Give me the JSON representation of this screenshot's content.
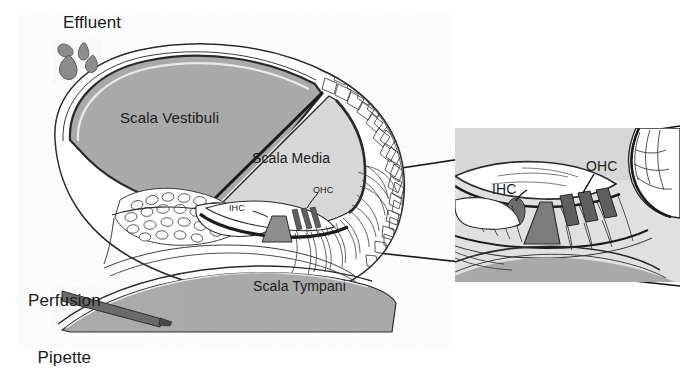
{
  "figure": {
    "type": "anatomical-diagram",
    "background_color": "#ffffff",
    "colors": {
      "scala_vestibuli_fill": "#a9a9a9",
      "scala_media_fill": "#d7d7d7",
      "scala_tympani_fill": "#a9a9a9",
      "outline": "#1a1a1a",
      "hair_cell_fill": "#6e6e6e",
      "pillar_fill": "#8e8e8e",
      "pipette_fill": "#6b6b6b",
      "droplet_fill": "#8c8c8c",
      "inset_background": "#e2e2e2",
      "leader_line": "#111111"
    },
    "labels": {
      "effluent": "Effluent",
      "scala_vestibuli": "Scala Vestibuli",
      "scala_media": "Scala Media",
      "scala_tympani": "Scala Tympani",
      "perfusion_pipette_line1": "Perfusion",
      "perfusion_pipette_line2": "Pipette",
      "ihc_main": "IHC",
      "ohc_main": "OHC",
      "ihc_inset": "IHC",
      "ohc_inset": "OHC"
    },
    "inset": {
      "region": "organ of Corti",
      "x": 455,
      "y": 128,
      "width": 225,
      "height": 154
    },
    "effluent_droplets": 4,
    "outer_hair_cell_count": 3,
    "inner_hair_cell_count": 1
  }
}
